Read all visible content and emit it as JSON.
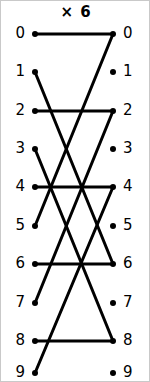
{
  "figure": {
    "title": "× 6",
    "width": 150,
    "height": 382,
    "background_color": "#ffffff",
    "border_color": "#c9c9c9",
    "line_color": "#000000",
    "dot_color": "#000000",
    "label_color": "#000000"
  },
  "labels": {
    "left": [
      "0",
      "1",
      "2",
      "3",
      "4",
      "5",
      "6",
      "7",
      "8",
      "9"
    ],
    "right": [
      "0",
      "1",
      "2",
      "3",
      "4",
      "5",
      "6",
      "7",
      "8",
      "9"
    ]
  },
  "chart_data": {
    "type": "diagram",
    "title": "× 6",
    "subtitle": "",
    "xlabel": "",
    "ylabel": "",
    "multiplier": 6,
    "modulus": 10,
    "left_nodes": [
      0,
      1,
      2,
      3,
      4,
      5,
      6,
      7,
      8,
      9
    ],
    "right_nodes": [
      0,
      1,
      2,
      3,
      4,
      5,
      6,
      7,
      8,
      9
    ],
    "edges": [
      {
        "from": 0,
        "to": 0
      },
      {
        "from": 1,
        "to": 6
      },
      {
        "from": 2,
        "to": 2
      },
      {
        "from": 3,
        "to": 8
      },
      {
        "from": 4,
        "to": 4
      },
      {
        "from": 5,
        "to": 0
      },
      {
        "from": 6,
        "to": 6
      },
      {
        "from": 7,
        "to": 2
      },
      {
        "from": 8,
        "to": 8
      },
      {
        "from": 9,
        "to": 4
      }
    ],
    "left_column_x": 34,
    "right_column_x": 112,
    "row_y": [
      33,
      71,
      110,
      148,
      186,
      225,
      263,
      302,
      340,
      372
    ],
    "dot_radius": 3,
    "line_width": 3,
    "legend": [],
    "grid": false
  }
}
